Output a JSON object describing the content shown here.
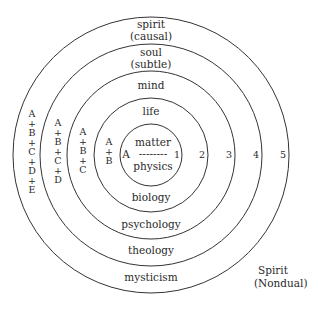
{
  "diagram": {
    "center": {
      "x": 151,
      "y": 155
    },
    "circles": [
      {
        "level": 1,
        "radius": 31,
        "top_label": [
          "matter"
        ],
        "bottom_label": "physics",
        "number": "1",
        "stack": [
          "A"
        ]
      },
      {
        "level": 2,
        "radius": 57,
        "top_label": [
          "life"
        ],
        "bottom_label": "biology",
        "number": "2",
        "stack": [
          "A",
          "+",
          "B"
        ]
      },
      {
        "level": 3,
        "radius": 84,
        "top_label": [
          "mind"
        ],
        "bottom_label": "psychology",
        "number": "3",
        "stack": [
          "A",
          "+",
          "B",
          "+",
          "C"
        ]
      },
      {
        "level": 4,
        "radius": 111,
        "top_label": [
          "soul",
          "(subtle)"
        ],
        "bottom_label": "theology",
        "number": "4",
        "stack": [
          "A",
          "+",
          "B",
          "+",
          "C",
          "+",
          "D"
        ]
      },
      {
        "level": 5,
        "radius": 138,
        "top_label": [
          "spirit",
          "(causal)"
        ],
        "bottom_label": "mysticism",
        "number": "5",
        "stack": [
          "A",
          "+",
          "B",
          "+",
          "C",
          "+",
          "D",
          "+",
          "E"
        ]
      }
    ],
    "inner": {
      "top": "matter",
      "divider": "--------",
      "bottom": "physics",
      "left": "A"
    },
    "outside_label": [
      "Spirit",
      "(Nondual)"
    ],
    "line_color": "#333333"
  }
}
